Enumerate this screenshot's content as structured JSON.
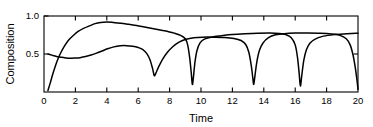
{
  "chart_data": {
    "type": "line",
    "title": "",
    "xlabel": "Time",
    "ylabel": "Composition",
    "xlim": [
      0,
      20
    ],
    "ylim": [
      0,
      1.0
    ],
    "grid": false,
    "legend": "none",
    "line_color": "#000000",
    "axis_color": "#000000",
    "background": "#ffffff",
    "xticks": [
      0,
      2,
      4,
      6,
      8,
      10,
      12,
      14,
      16,
      18,
      20
    ],
    "xtick_labels": [
      "0",
      "2",
      "4",
      "6",
      "8",
      "10",
      "12",
      "14",
      "16",
      "18",
      "20"
    ],
    "yticks": [
      0.5,
      1.0
    ],
    "ytick_labels": [
      "0.5",
      "1.0"
    ],
    "series": [
      {
        "name": "curve-a",
        "points": [
          [
            0.25,
            0.02
          ],
          [
            0.4,
            0.12
          ],
          [
            0.55,
            0.23
          ],
          [
            0.72,
            0.34
          ],
          [
            0.9,
            0.44
          ],
          [
            1.1,
            0.53
          ],
          [
            1.35,
            0.62
          ],
          [
            1.6,
            0.69
          ],
          [
            1.9,
            0.75
          ],
          [
            2.2,
            0.8
          ],
          [
            2.55,
            0.84
          ],
          [
            2.9,
            0.87
          ],
          [
            3.25,
            0.9
          ],
          [
            3.6,
            0.915
          ],
          [
            4.0,
            0.92
          ],
          [
            4.4,
            0.915
          ],
          [
            4.9,
            0.905
          ],
          [
            5.4,
            0.89
          ],
          [
            5.9,
            0.875
          ],
          [
            6.4,
            0.855
          ],
          [
            6.9,
            0.835
          ],
          [
            7.4,
            0.815
          ],
          [
            7.9,
            0.795
          ],
          [
            8.3,
            0.775
          ],
          [
            8.7,
            0.745
          ],
          [
            9.0,
            0.7
          ],
          [
            9.15,
            0.62
          ],
          [
            9.28,
            0.45
          ],
          [
            9.38,
            0.25
          ],
          [
            9.45,
            0.1
          ],
          [
            9.52,
            0.2
          ],
          [
            9.62,
            0.4
          ],
          [
            9.75,
            0.55
          ],
          [
            9.95,
            0.65
          ],
          [
            10.25,
            0.7
          ],
          [
            10.7,
            0.725
          ],
          [
            11.3,
            0.74
          ],
          [
            12.0,
            0.755
          ],
          [
            12.8,
            0.765
          ],
          [
            13.6,
            0.772
          ],
          [
            14.4,
            0.775
          ],
          [
            15.0,
            0.77
          ],
          [
            15.4,
            0.755
          ],
          [
            15.75,
            0.715
          ],
          [
            16.0,
            0.62
          ],
          [
            16.15,
            0.45
          ],
          [
            16.25,
            0.25
          ],
          [
            16.33,
            0.08
          ],
          [
            16.42,
            0.22
          ],
          [
            16.55,
            0.42
          ],
          [
            16.72,
            0.56
          ],
          [
            16.95,
            0.645
          ],
          [
            17.3,
            0.7
          ],
          [
            17.8,
            0.735
          ],
          [
            18.5,
            0.755
          ],
          [
            19.3,
            0.768
          ],
          [
            20.0,
            0.772
          ]
        ]
      },
      {
        "name": "curve-b",
        "points": [
          [
            0.25,
            0.5
          ],
          [
            0.5,
            0.485
          ],
          [
            0.8,
            0.468
          ],
          [
            1.1,
            0.456
          ],
          [
            1.4,
            0.448
          ],
          [
            1.7,
            0.444
          ],
          [
            2.0,
            0.446
          ],
          [
            2.3,
            0.452
          ],
          [
            2.65,
            0.466
          ],
          [
            3.0,
            0.486
          ],
          [
            3.35,
            0.512
          ],
          [
            3.7,
            0.54
          ],
          [
            4.05,
            0.568
          ],
          [
            4.45,
            0.594
          ],
          [
            4.85,
            0.608
          ],
          [
            5.25,
            0.61
          ],
          [
            5.65,
            0.602
          ],
          [
            6.0,
            0.585
          ],
          [
            6.3,
            0.558
          ],
          [
            6.55,
            0.505
          ],
          [
            6.75,
            0.425
          ],
          [
            6.92,
            0.305
          ],
          [
            7.02,
            0.215
          ],
          [
            7.12,
            0.245
          ],
          [
            7.3,
            0.33
          ],
          [
            7.55,
            0.43
          ],
          [
            7.85,
            0.52
          ],
          [
            8.2,
            0.595
          ],
          [
            8.6,
            0.655
          ],
          [
            9.05,
            0.695
          ],
          [
            9.55,
            0.715
          ],
          [
            10.1,
            0.722
          ],
          [
            10.8,
            0.722
          ],
          [
            11.5,
            0.718
          ],
          [
            12.1,
            0.705
          ],
          [
            12.55,
            0.678
          ],
          [
            12.85,
            0.625
          ],
          [
            13.05,
            0.52
          ],
          [
            13.2,
            0.35
          ],
          [
            13.3,
            0.185
          ],
          [
            13.36,
            0.1
          ],
          [
            13.44,
            0.22
          ],
          [
            13.56,
            0.4
          ],
          [
            13.72,
            0.545
          ],
          [
            13.95,
            0.645
          ],
          [
            14.3,
            0.715
          ],
          [
            14.75,
            0.752
          ],
          [
            15.3,
            0.768
          ],
          [
            16.0,
            0.775
          ],
          [
            16.8,
            0.775
          ],
          [
            17.6,
            0.772
          ],
          [
            18.3,
            0.763
          ],
          [
            18.85,
            0.745
          ],
          [
            19.25,
            0.7
          ],
          [
            19.5,
            0.62
          ],
          [
            19.68,
            0.49
          ],
          [
            19.82,
            0.33
          ],
          [
            19.93,
            0.165
          ],
          [
            20.0,
            0.035
          ]
        ]
      }
    ]
  }
}
